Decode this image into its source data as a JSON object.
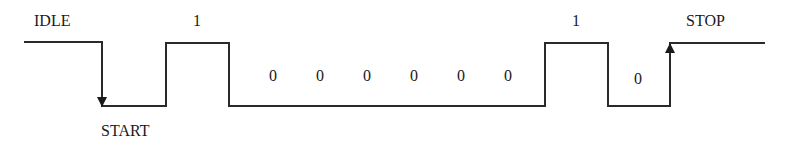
{
  "diagram": {
    "colors": {
      "line": "#2a2a2a",
      "text": "#1a1a1a",
      "background": "#ffffff"
    },
    "labels": {
      "idle": "IDLE",
      "start": "START",
      "stop": "STOP"
    },
    "bits": [
      "1",
      "0",
      "0",
      "0",
      "0",
      "0",
      "0",
      "1",
      "0"
    ],
    "levels": [
      "high-idle",
      "low-start",
      "1",
      "0",
      "0",
      "0",
      "0",
      "0",
      "0",
      "1",
      "0",
      "high-stop"
    ]
  }
}
